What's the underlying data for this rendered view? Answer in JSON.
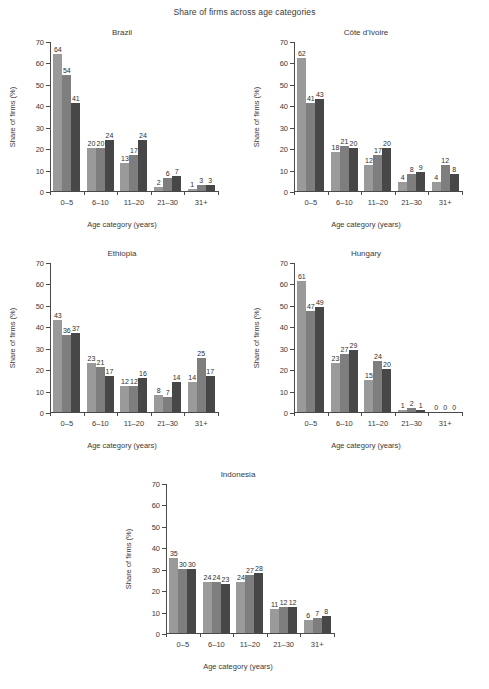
{
  "figure": {
    "title": "Share of firms across age categories",
    "xlabel": "Age category (years)",
    "ylabel": "Share of firms (%)",
    "ytick_labels": [
      "0",
      "10",
      "20",
      "30",
      "40",
      "50",
      "60",
      "70"
    ],
    "categories": [
      "0–5",
      "6–10",
      "11–20",
      "21–30",
      "31+"
    ],
    "colors": {
      "series1": "#9a9a9a",
      "series2": "#7e7e7e",
      "series3": "#474747",
      "axis": "#4a4a4a",
      "text": "#3a3a3a",
      "background": "#ffffff"
    }
  },
  "chart_data": [
    {
      "type": "bar",
      "title": "Brazil",
      "xlabel": "Age category (years)",
      "ylabel": "Share of firms (%)",
      "ylim": [
        0,
        70
      ],
      "ytick_interval": 10,
      "grid": false,
      "legend": "none",
      "categories": [
        "0–5",
        "6–10",
        "11–20",
        "21–30",
        "31+"
      ],
      "series": [
        {
          "name": "series1",
          "values": [
            64,
            20,
            13,
            2,
            1
          ]
        },
        {
          "name": "series2",
          "values": [
            54,
            20,
            17,
            6,
            3
          ]
        },
        {
          "name": "series3",
          "values": [
            41,
            24,
            24,
            7,
            3
          ]
        }
      ]
    },
    {
      "type": "bar",
      "title": "Côte d'Ivoire",
      "xlabel": "Age category (years)",
      "ylabel": "Share of firms (%)",
      "ylim": [
        0,
        70
      ],
      "ytick_interval": 10,
      "grid": false,
      "legend": "none",
      "categories": [
        "0–5",
        "6–10",
        "11–20",
        "21–30",
        "31+"
      ],
      "series": [
        {
          "name": "series1",
          "values": [
            62,
            18,
            12,
            4,
            4
          ]
        },
        {
          "name": "series2",
          "values": [
            41,
            21,
            17,
            8,
            12
          ]
        },
        {
          "name": "series3",
          "values": [
            43,
            20,
            20,
            9,
            8
          ]
        }
      ]
    },
    {
      "type": "bar",
      "title": "Ethiopia",
      "xlabel": "Age category (years)",
      "ylabel": "Share of firms (%)",
      "ylim": [
        0,
        70
      ],
      "ytick_interval": 10,
      "grid": false,
      "legend": "none",
      "categories": [
        "0–5",
        "6–10",
        "11–20",
        "21–30",
        "31+"
      ],
      "series": [
        {
          "name": "series1",
          "values": [
            43,
            23,
            12,
            8,
            14
          ]
        },
        {
          "name": "series2",
          "values": [
            36,
            21,
            12,
            7,
            25
          ]
        },
        {
          "name": "series3",
          "values": [
            37,
            17,
            16,
            14,
            17
          ]
        }
      ]
    },
    {
      "type": "bar",
      "title": "Hungary",
      "xlabel": "Age category (years)",
      "ylabel": "Share of firms (%)",
      "ylim": [
        0,
        70
      ],
      "ytick_interval": 10,
      "grid": false,
      "legend": "none",
      "categories": [
        "0–5",
        "6–10",
        "11–20",
        "21–30",
        "31+"
      ],
      "series": [
        {
          "name": "series1",
          "values": [
            61,
            23,
            15,
            1,
            0
          ]
        },
        {
          "name": "series2",
          "values": [
            47,
            27,
            24,
            2,
            0
          ]
        },
        {
          "name": "series3",
          "values": [
            49,
            29,
            20,
            1,
            0
          ]
        }
      ]
    },
    {
      "type": "bar",
      "title": "Indonesia",
      "xlabel": "Age category (years)",
      "ylabel": "Share of firms (%)",
      "ylim": [
        0,
        70
      ],
      "ytick_interval": 10,
      "grid": false,
      "legend": "none",
      "categories": [
        "0–5",
        "6–10",
        "11–20",
        "21–30",
        "31+"
      ],
      "series": [
        {
          "name": "series1",
          "values": [
            35,
            24,
            24,
            11,
            6
          ]
        },
        {
          "name": "series2",
          "values": [
            30,
            24,
            27,
            12,
            7
          ]
        },
        {
          "name": "series3",
          "values": [
            30,
            23,
            28,
            12,
            8
          ]
        }
      ]
    }
  ]
}
